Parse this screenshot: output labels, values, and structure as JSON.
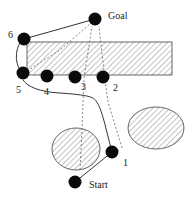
{
  "diagram": {
    "nodes": [
      {
        "id": "goal",
        "label": "Goal"
      },
      {
        "id": "n6",
        "label": "6"
      },
      {
        "id": "n5",
        "label": "5"
      },
      {
        "id": "n4",
        "label": "4"
      },
      {
        "id": "n3",
        "label": "3"
      },
      {
        "id": "n2",
        "label": "2"
      },
      {
        "id": "n1",
        "label": "1"
      },
      {
        "id": "start",
        "label": "Start"
      }
    ],
    "obstacles": [
      {
        "id": "rect-obstacle",
        "shape": "rectangle",
        "fill": "hatched"
      },
      {
        "id": "left-ellipse-obstacle",
        "shape": "ellipse",
        "fill": "hatched"
      },
      {
        "id": "right-ellipse-obstacle",
        "shape": "ellipse",
        "fill": "hatched"
      }
    ],
    "solid_path": [
      "start",
      "n1",
      "n5",
      "n6",
      "goal"
    ],
    "dashed_paths": [
      [
        "n1",
        "n2",
        "goal"
      ],
      [
        "left-ellipse",
        "n3",
        "goal"
      ],
      [
        "n5",
        "goal"
      ]
    ],
    "colors": {
      "node": "#0a0a0a",
      "line": "#333333",
      "hatch": "#888888"
    }
  }
}
